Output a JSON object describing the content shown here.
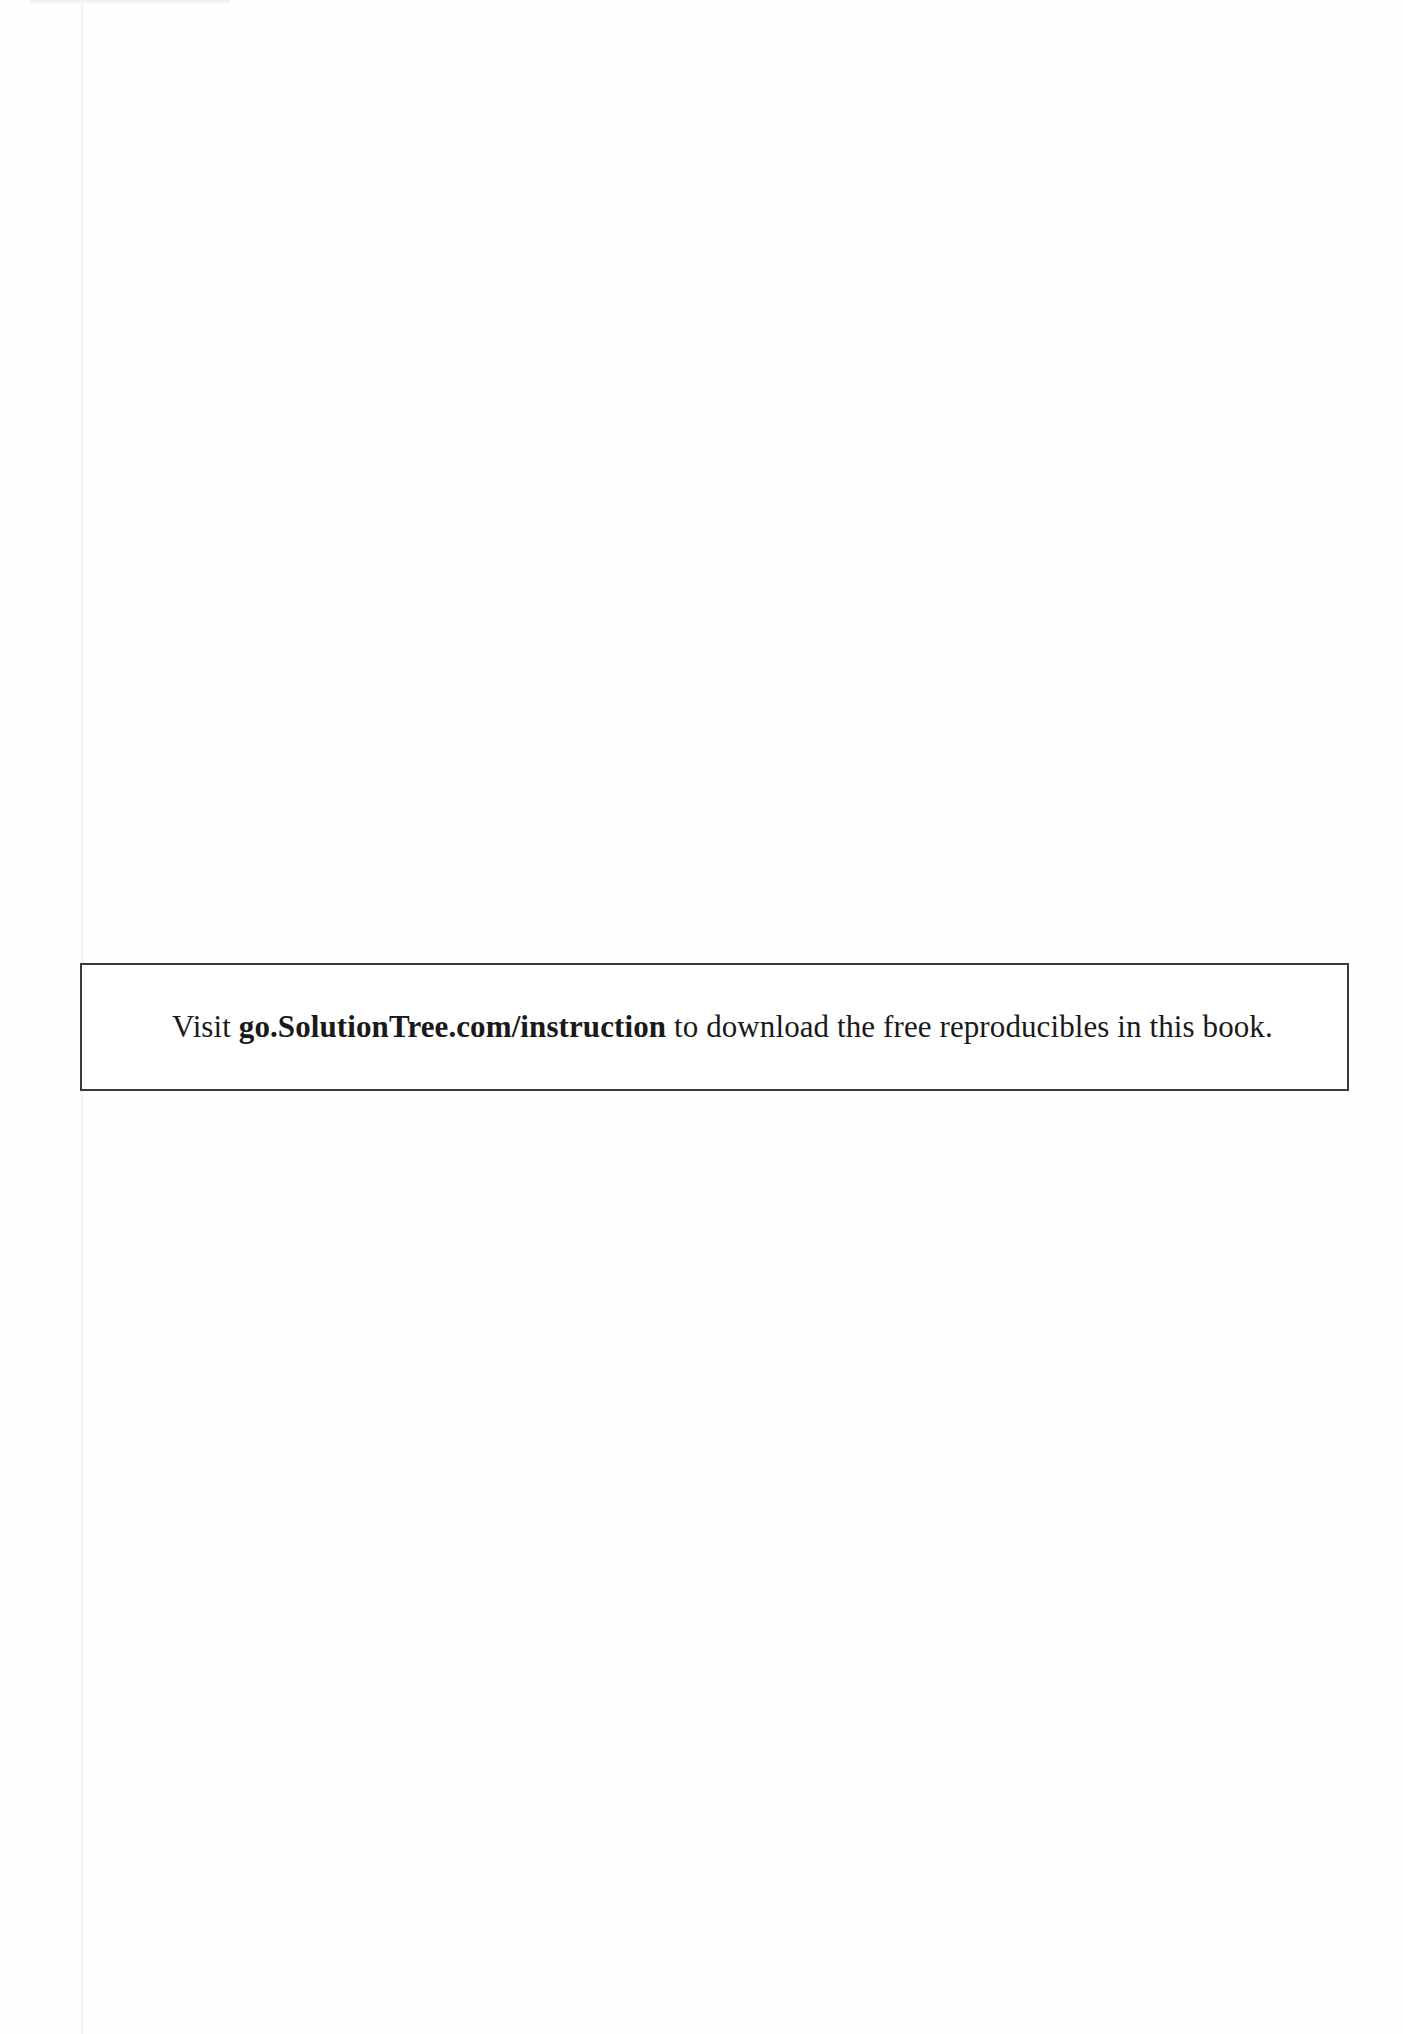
{
  "page": {
    "background": "#fefefe",
    "notice": {
      "prefix": "Visit ",
      "url": "go.SolutionTree.com/instruction",
      "suffix": " to download the free reproducibles in this book.",
      "border_color": "#3a3a3a"
    }
  }
}
